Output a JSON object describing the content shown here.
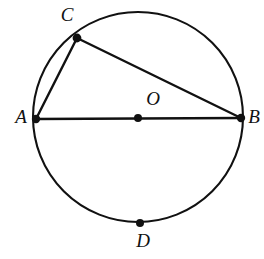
{
  "figure": {
    "background_color": "#ffffff",
    "stroke_color": "#111111",
    "width": 264,
    "height": 259,
    "circle": {
      "name": "circle-outline",
      "cx": 138,
      "cy": 117,
      "r": 105,
      "stroke_width": 2.1
    },
    "points": [
      {
        "id": "A",
        "label": "A",
        "x": 36,
        "y": 119,
        "label_x": 21,
        "label_y": 119,
        "dot_r": 4.2
      },
      {
        "id": "B",
        "label": "B",
        "x": 241,
        "y": 118,
        "label_x": 254,
        "label_y": 119,
        "dot_r": 4.2
      },
      {
        "id": "C",
        "label": "C",
        "x": 77,
        "y": 38,
        "label_x": 67,
        "label_y": 17,
        "dot_r": 4.4
      },
      {
        "id": "D",
        "label": "D",
        "x": 140,
        "y": 223,
        "label_x": 143,
        "label_y": 243,
        "dot_r": 4.0
      },
      {
        "id": "O",
        "label": "O",
        "x": 138,
        "y": 118,
        "label_x": 153,
        "label_y": 101,
        "dot_r": 4.0
      }
    ],
    "segments": [
      {
        "id": "AB",
        "name": "segment-ab-diameter",
        "from": "A",
        "to": "B",
        "x1": 36,
        "y1": 119,
        "x2": 241,
        "y2": 118
      },
      {
        "id": "AC",
        "name": "segment-ac-chord",
        "from": "A",
        "to": "C",
        "x1": 36,
        "y1": 119,
        "x2": 77,
        "y2": 38
      },
      {
        "id": "CB",
        "name": "segment-cb-chord",
        "from": "C",
        "to": "B",
        "x1": 77,
        "y1": 38,
        "x2": 241,
        "y2": 118
      }
    ]
  }
}
